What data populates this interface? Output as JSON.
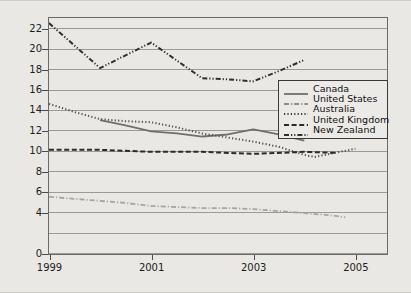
{
  "chart_data": {
    "type": "line",
    "title": "",
    "xlabel": "",
    "ylabel": "Rate per 100 000 population",
    "xlim": [
      1999,
      2005.6
    ],
    "ylim": [
      0,
      23
    ],
    "grid": true,
    "legend_position": "center-right",
    "x_tick_labels": [
      "1999",
      "2001",
      "2003",
      "2005"
    ],
    "x_ticks": [
      1999,
      2001,
      2003,
      2005
    ],
    "y_tick_labels": [
      "0",
      "4",
      "6",
      "8",
      "10",
      "12",
      "14",
      "16",
      "18",
      "20",
      "22"
    ],
    "y_ticks": [
      0,
      4,
      6,
      8,
      10,
      12,
      14,
      16,
      18,
      20,
      22
    ],
    "y_gridlines": [
      0,
      2,
      4,
      6,
      8,
      10,
      12,
      14,
      16,
      18,
      20,
      22
    ],
    "series": [
      {
        "name": "Canada",
        "style": "solid",
        "color": "#6f6f6f",
        "x": [
          2000.0,
          2000.5,
          2001.0,
          2001.5,
          2002.0,
          2002.5,
          2003.0,
          2003.5,
          2004.0
        ],
        "values": [
          13.0,
          12.5,
          11.9,
          11.7,
          11.4,
          11.6,
          12.1,
          11.6,
          11.0
        ]
      },
      {
        "name": "United States",
        "style": "dash-dot",
        "color": "#a5a5a2",
        "x": [
          1999,
          1999.5,
          2000,
          2000.5,
          2001,
          2001.5,
          2002,
          2002.5,
          2003,
          2003.5,
          2004,
          2004.5,
          2004.8
        ],
        "values": [
          5.5,
          5.3,
          5.1,
          4.9,
          4.6,
          4.5,
          4.4,
          4.4,
          4.3,
          4.1,
          3.9,
          3.7,
          3.5
        ]
      },
      {
        "name": "Australia",
        "style": "dotted",
        "color": "#4f4f4f",
        "x": [
          1999,
          1999.5,
          2000,
          2000.5,
          2001,
          2001.5,
          2002,
          2002.5,
          2003,
          2003.5,
          2004,
          2004.2,
          2004.6,
          2005.0
        ],
        "values": [
          14.6,
          13.8,
          13.1,
          12.9,
          12.8,
          12.3,
          11.7,
          11.3,
          10.9,
          10.4,
          9.6,
          9.4,
          9.8,
          10.2
        ]
      },
      {
        "name": "United Kingdom",
        "style": "dashed",
        "color": "#2b2b2b",
        "x": [
          1999,
          2000,
          2001,
          2002,
          2003,
          2004,
          2004.6
        ],
        "values": [
          10.1,
          10.1,
          9.9,
          9.9,
          9.7,
          9.9,
          9.8
        ]
      },
      {
        "name": "New Zealand",
        "style": "dash-dot-dot",
        "color": "#303030",
        "x": [
          1999,
          2000,
          2001,
          2002,
          2002.5,
          2003,
          2003.5,
          2004
        ],
        "values": [
          22.5,
          18.1,
          20.6,
          17.1,
          17.0,
          16.8,
          17.8,
          18.9
        ]
      }
    ]
  },
  "legend": {
    "items": [
      {
        "label": "Canada"
      },
      {
        "label": "United States"
      },
      {
        "label": "Australia"
      },
      {
        "label": "United Kingdom"
      },
      {
        "label": "New Zealand"
      }
    ]
  }
}
